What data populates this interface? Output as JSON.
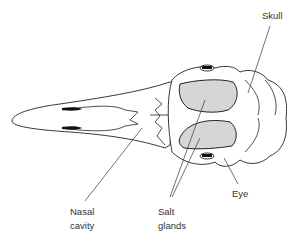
{
  "figure": {
    "labels": {
      "skull": "Skull",
      "eye": "Eye",
      "nasal_line1": "Nasal",
      "nasal_line2": "cavity",
      "salt_line1": "Salt",
      "salt_line2": "glands"
    },
    "colors": {
      "gland_fill": "#d6d6d6",
      "outline": "#222222",
      "background": "#ffffff"
    }
  }
}
